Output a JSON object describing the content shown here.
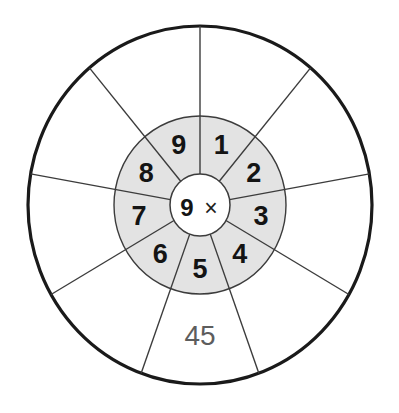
{
  "worksheet": {
    "type": "multiplication-wheel",
    "title": "9 times table wheel",
    "center": {
      "multiplier": "9",
      "operator_icon": "multiplication-sign",
      "operator": "×"
    },
    "colors": {
      "ring_fill": "#e3e3e3",
      "outer_fill": "#ffffff",
      "hub_fill": "#ffffff",
      "outer_stroke": "#1a1a1a",
      "spoke_stroke": "#3c3c3c",
      "digit_color": "#141414",
      "answer_color": "#5d5d5d",
      "page_background": "#ffffff"
    },
    "geometry": {
      "center_x": 200,
      "center_y": 205,
      "outer_radius": 173,
      "ring_outer_radius": 88,
      "hub_radius": 31,
      "segment_count": 9,
      "start_angle_deg": -90
    },
    "inner_ring": {
      "name": "multiplicand-ring",
      "segments": [
        {
          "position": 1,
          "label": "1"
        },
        {
          "position": 2,
          "label": "2"
        },
        {
          "position": 3,
          "label": "3"
        },
        {
          "position": 4,
          "label": "4"
        },
        {
          "position": 5,
          "label": "5"
        },
        {
          "position": 6,
          "label": "6"
        },
        {
          "position": 7,
          "label": "7"
        },
        {
          "position": 8,
          "label": "8"
        },
        {
          "position": 9,
          "label": "9"
        }
      ]
    },
    "outer_ring": {
      "name": "answer-ring",
      "segments": [
        {
          "position": 1,
          "label": ""
        },
        {
          "position": 2,
          "label": ""
        },
        {
          "position": 3,
          "label": ""
        },
        {
          "position": 4,
          "label": ""
        },
        {
          "position": 5,
          "label": "45"
        },
        {
          "position": 6,
          "label": ""
        },
        {
          "position": 7,
          "label": ""
        },
        {
          "position": 8,
          "label": ""
        },
        {
          "position": 9,
          "label": ""
        }
      ]
    }
  }
}
